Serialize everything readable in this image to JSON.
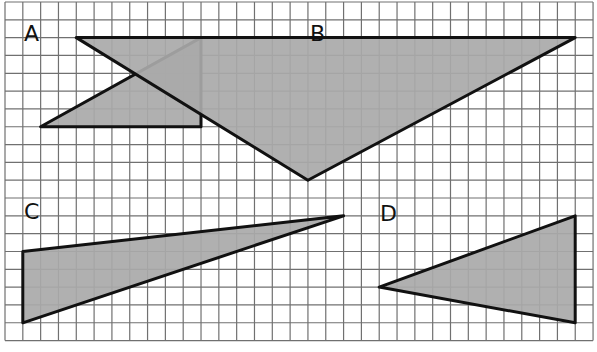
{
  "grid": {
    "origin_x": 5,
    "origin_y": 2,
    "cell": 17.82,
    "cols": 33,
    "rows": 19,
    "line_color": "#707070",
    "background": "#ffffff"
  },
  "style": {
    "fill": "#a9a9a9",
    "stroke": "#111111",
    "stroke_width": 3
  },
  "triangles": [
    {
      "label": "A",
      "label_pos": [
        24,
        41
      ],
      "vertices": [
        [
          2,
          7
        ],
        [
          11,
          7
        ],
        [
          11,
          2
        ]
      ]
    },
    {
      "label": "B",
      "label_pos": [
        310,
        41
      ],
      "vertices": [
        [
          4,
          2
        ],
        [
          32,
          2
        ],
        [
          17,
          10
        ]
      ]
    },
    {
      "label": "C",
      "label_pos": [
        24,
        219
      ],
      "vertices": [
        [
          1,
          14
        ],
        [
          19,
          12
        ],
        [
          1,
          18
        ]
      ]
    },
    {
      "label": "D",
      "label_pos": [
        380,
        221
      ],
      "vertices": [
        [
          21,
          16
        ],
        [
          32,
          12
        ],
        [
          32,
          18
        ]
      ]
    }
  ]
}
